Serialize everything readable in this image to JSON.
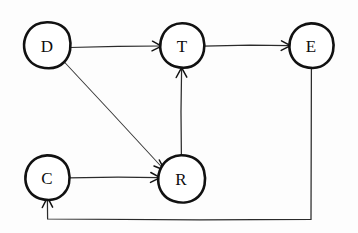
{
  "diagram": {
    "title": "",
    "type": "directed-graph",
    "style": "hand-drawn-sketch",
    "background_color": "#fdfdfd",
    "stroke_color": "#111111",
    "canvas": {
      "width": 358,
      "height": 233
    },
    "nodes": [
      {
        "id": "D",
        "label": "D",
        "cx": 47,
        "cy": 45,
        "r": 23
      },
      {
        "id": "T",
        "label": "T",
        "cx": 182,
        "cy": 45,
        "r": 22
      },
      {
        "id": "E",
        "label": "E",
        "cx": 311,
        "cy": 45,
        "r": 22
      },
      {
        "id": "C",
        "label": "C",
        "cx": 47,
        "cy": 177,
        "r": 22
      },
      {
        "id": "R",
        "label": "R",
        "cx": 181,
        "cy": 178,
        "r": 23
      }
    ],
    "edges": [
      {
        "id": "d-t",
        "from": "D",
        "to": "T",
        "shape": "straight",
        "directed": true
      },
      {
        "id": "t-e",
        "from": "T",
        "to": "E",
        "shape": "straight",
        "directed": true
      },
      {
        "id": "d-r",
        "from": "D",
        "to": "R",
        "shape": "diagonal",
        "directed": true
      },
      {
        "id": "c-r",
        "from": "C",
        "to": "R",
        "shape": "straight",
        "directed": true
      },
      {
        "id": "r-t",
        "from": "R",
        "to": "T",
        "shape": "vertical",
        "directed": true
      },
      {
        "id": "e-c",
        "from": "E",
        "to": "C",
        "shape": "orthogonal-feedback",
        "directed": true
      }
    ]
  }
}
